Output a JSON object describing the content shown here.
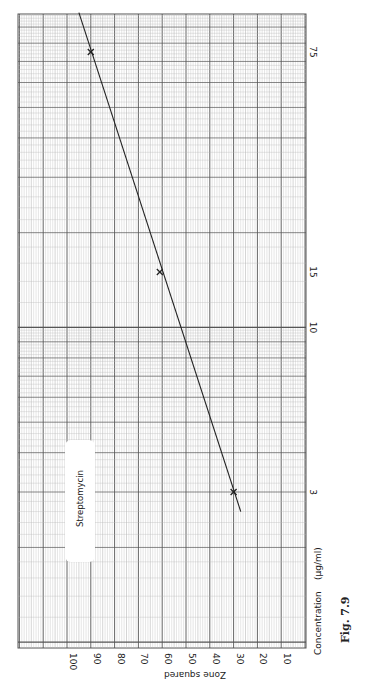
{
  "chart_data": {
    "type": "line",
    "orientation": "rotated-90",
    "title": "",
    "figure_label": "Fig. 7.9",
    "legend": [
      "Streptomycin"
    ],
    "xlabel": "Zone squared",
    "ylabel": "Concentration (µg/ml)",
    "x_ticks": [
      100,
      90,
      80,
      70,
      60,
      50,
      40,
      30,
      20,
      10
    ],
    "y_ticks": [
      3,
      10,
      15,
      75
    ],
    "y_scale": "log",
    "xlim": [
      0,
      110
    ],
    "grid": true,
    "series": [
      {
        "name": "Streptomycin",
        "points": [
          {
            "zone_squared": 30,
            "concentration": 3
          },
          {
            "zone_squared": 61,
            "concentration": 15
          },
          {
            "zone_squared": 90,
            "concentration": 75
          }
        ],
        "fit_line": {
          "start": {
            "zone_squared": 27,
            "concentration": 2.6
          },
          "end": {
            "zone_squared": 95,
            "concentration": 100
          }
        }
      }
    ]
  },
  "labels": {
    "x_axis_title": "Zone squared",
    "y_axis_title": "Concentration",
    "y_axis_unit": "(µg/ml)",
    "figure": "Fig. 7.9",
    "legend": "Streptomycin"
  },
  "ticks": {
    "x": [
      "100",
      "90",
      "80",
      "70",
      "60",
      "50",
      "40",
      "30",
      "20",
      "10"
    ],
    "y": [
      "75",
      "15",
      "10",
      "3"
    ]
  },
  "colors": {
    "paper": "#ffffff",
    "grid_minor": "#b8b8b8",
    "grid_major": "#555555",
    "ink": "#222222"
  }
}
